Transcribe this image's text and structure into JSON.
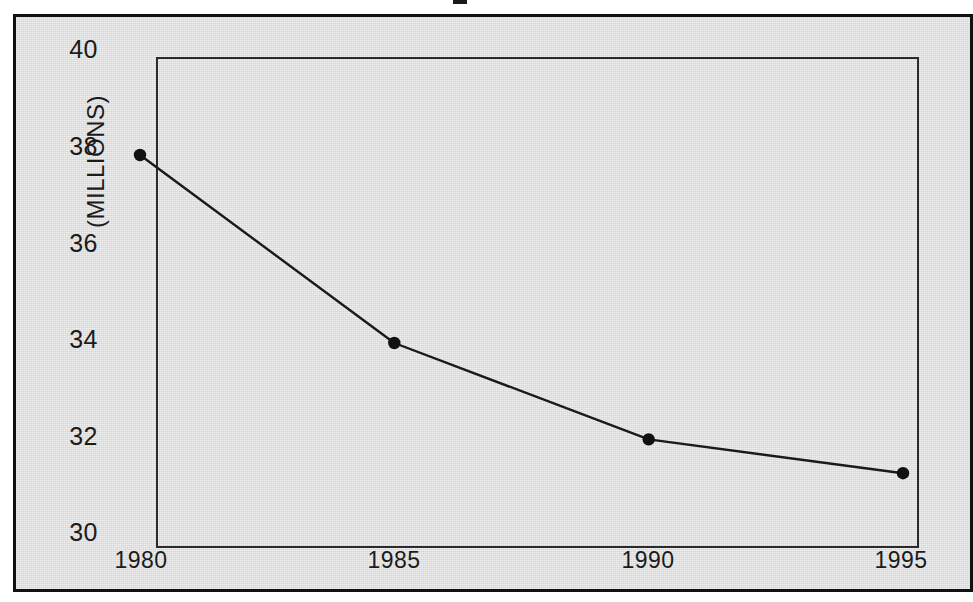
{
  "figure": {
    "cropped_title_fragment": "",
    "background_color": "#dddcdc",
    "frame_color": "#111111",
    "line_color": "#1a1a1a"
  },
  "chart_data": {
    "type": "line",
    "title": "",
    "xlabel": "",
    "ylabel": "(MILLIONS)",
    "x": [
      1980,
      1985,
      1990,
      1995
    ],
    "categories": [
      "1980",
      "1985",
      "1990",
      "1995"
    ],
    "values": [
      37.8,
      33.9,
      31.9,
      31.2
    ],
    "series": [
      {
        "name": "(MILLIONS)",
        "values": [
          37.8,
          33.9,
          31.9,
          31.2
        ]
      }
    ],
    "xlim": [
      1980,
      1995
    ],
    "ylim": [
      30,
      40
    ],
    "ytick_labels": [
      "40",
      "38",
      "36",
      "34",
      "32",
      "30"
    ],
    "ytick_values": [
      40,
      38,
      36,
      34,
      32,
      30
    ],
    "xtick_labels": [
      "1980",
      "1985",
      "1990",
      "1995"
    ],
    "xtick_values": [
      1980,
      1985,
      1990,
      1995
    ],
    "grid": false,
    "legend": false,
    "markers": "filled-circle"
  }
}
